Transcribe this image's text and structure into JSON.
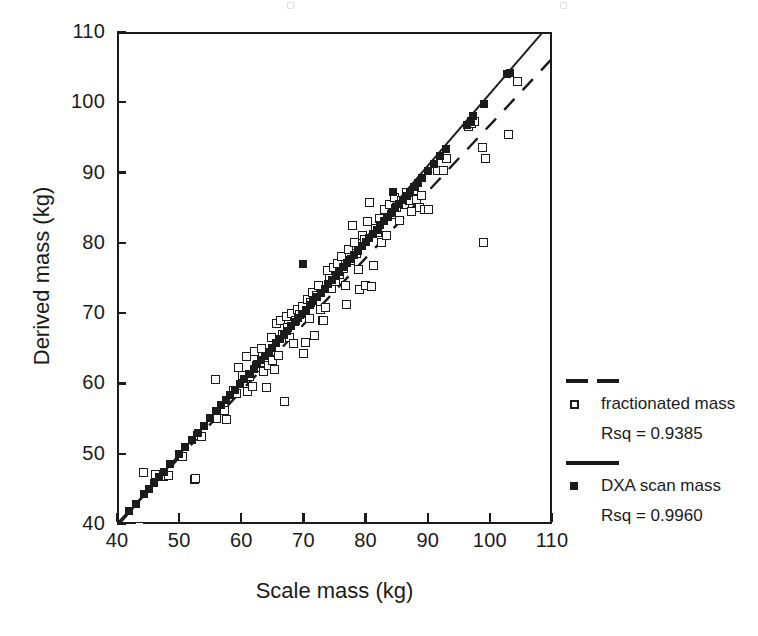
{
  "chart_data": {
    "type": "scatter",
    "title": "",
    "xlabel": "Scale mass (kg)",
    "ylabel": "Derived mass (kg)",
    "xlim": [
      40,
      110
    ],
    "ylim": [
      40,
      110
    ],
    "xticks": [
      40,
      50,
      60,
      70,
      80,
      90,
      100,
      110
    ],
    "yticks": [
      40,
      50,
      60,
      70,
      80,
      90,
      100,
      110
    ],
    "grid": false,
    "legend_position": "right",
    "marker_colors": {
      "open": "#ffffff",
      "edge": "#1b1b1b",
      "filled": "#1b1b1b"
    },
    "series": [
      {
        "name": "fractionated mass",
        "marker": "open-square",
        "rsq_label": "Rsq = 0.9385",
        "rsq": 0.9385,
        "fit_line": {
          "style": "dashed",
          "x": [
            40,
            110
          ],
          "y": [
            40,
            106.2
          ]
        },
        "points": [
          [
            43.6,
            39.6
          ],
          [
            44.3,
            47.3
          ],
          [
            46.2,
            47.0
          ],
          [
            47.5,
            46.8
          ],
          [
            48.3,
            46.9
          ],
          [
            50.6,
            49.6
          ],
          [
            52.4,
            46.4
          ],
          [
            52.6,
            46.5
          ],
          [
            53.0,
            52.6
          ],
          [
            53.6,
            52.5
          ],
          [
            55.8,
            60.5
          ],
          [
            56.0,
            55.0
          ],
          [
            56.8,
            56.2
          ],
          [
            57.3,
            56.1
          ],
          [
            57.6,
            54.9
          ],
          [
            58.8,
            59.0
          ],
          [
            59.2,
            58.6
          ],
          [
            59.6,
            62.2
          ],
          [
            60.2,
            61.1
          ],
          [
            60.8,
            63.8
          ],
          [
            61.0,
            58.9
          ],
          [
            61.4,
            61.0
          ],
          [
            61.8,
            59.6
          ],
          [
            62.1,
            64.6
          ],
          [
            62.5,
            62.5
          ],
          [
            62.9,
            62.2
          ],
          [
            63.2,
            65.0
          ],
          [
            63.5,
            61.7
          ],
          [
            63.8,
            63.0
          ],
          [
            64.0,
            59.4
          ],
          [
            64.4,
            62.5
          ],
          [
            64.8,
            66.5
          ],
          [
            65.0,
            63.3
          ],
          [
            65.4,
            62.0
          ],
          [
            65.6,
            68.5
          ],
          [
            66.0,
            64.0
          ],
          [
            66.3,
            69.0
          ],
          [
            66.6,
            67.0
          ],
          [
            66.9,
            57.5
          ],
          [
            67.2,
            69.5
          ],
          [
            67.5,
            68.0
          ],
          [
            67.8,
            66.5
          ],
          [
            68.0,
            70.0
          ],
          [
            68.4,
            65.7
          ],
          [
            68.8,
            68.9
          ],
          [
            69.0,
            70.5
          ],
          [
            69.4,
            69.8
          ],
          [
            69.8,
            71.0
          ],
          [
            70.0,
            64.2
          ],
          [
            70.3,
            65.8
          ],
          [
            70.6,
            72.0
          ],
          [
            70.9,
            69.2
          ],
          [
            71.2,
            71.5
          ],
          [
            71.5,
            73.0
          ],
          [
            71.8,
            66.8
          ],
          [
            72.1,
            72.5
          ],
          [
            72.4,
            74.0
          ],
          [
            72.7,
            70.5
          ],
          [
            73.0,
            68.9
          ],
          [
            73.3,
            69.0
          ],
          [
            73.6,
            70.8
          ],
          [
            73.9,
            76.0
          ],
          [
            74.2,
            75.0
          ],
          [
            74.5,
            73.5
          ],
          [
            74.8,
            76.5
          ],
          [
            75.1,
            74.5
          ],
          [
            75.5,
            77.0
          ],
          [
            75.8,
            75.5
          ],
          [
            76.1,
            78.0
          ],
          [
            76.4,
            76.3
          ],
          [
            76.8,
            74.0
          ],
          [
            77.0,
            71.2
          ],
          [
            77.3,
            79.0
          ],
          [
            77.6,
            77.5
          ],
          [
            77.9,
            82.5
          ],
          [
            78.2,
            80.0
          ],
          [
            78.5,
            78.5
          ],
          [
            78.8,
            76.2
          ],
          [
            79.1,
            73.3
          ],
          [
            79.5,
            81.0
          ],
          [
            79.8,
            80.5
          ],
          [
            80.0,
            74.0
          ],
          [
            80.3,
            83.0
          ],
          [
            80.6,
            85.8
          ],
          [
            81.0,
            73.8
          ],
          [
            81.3,
            76.8
          ],
          [
            81.6,
            82.0
          ],
          [
            81.9,
            81.5
          ],
          [
            82.2,
            83.5
          ],
          [
            82.6,
            80.1
          ],
          [
            83.0,
            84.8
          ],
          [
            83.4,
            81.0
          ],
          [
            83.8,
            85.5
          ],
          [
            84.2,
            84.0
          ],
          [
            84.6,
            86.5
          ],
          [
            85.0,
            85.0
          ],
          [
            85.4,
            83.2
          ],
          [
            85.8,
            86.0
          ],
          [
            86.2,
            85.4
          ],
          [
            86.6,
            87.2
          ],
          [
            87.0,
            86.0
          ],
          [
            87.4,
            84.5
          ],
          [
            87.8,
            87.5
          ],
          [
            88.2,
            86.2
          ],
          [
            88.6,
            85.0
          ],
          [
            89.0,
            86.8
          ],
          [
            89.5,
            84.8
          ],
          [
            90.2,
            84.7
          ],
          [
            91.5,
            90.3
          ],
          [
            92.5,
            90.3
          ],
          [
            93.0,
            92.0
          ],
          [
            96.5,
            96.5
          ],
          [
            97.0,
            97.0
          ],
          [
            97.6,
            97.3
          ],
          [
            98.8,
            93.5
          ],
          [
            99.0,
            80.1
          ],
          [
            99.3,
            92.0
          ],
          [
            103.0,
            95.4
          ],
          [
            104.5,
            103.0
          ]
        ]
      },
      {
        "name": "DXA scan mass",
        "marker": "filled-square",
        "rsq_label": "Rsq = 0.9960",
        "rsq": 0.996,
        "fit_line": {
          "style": "solid",
          "x": [
            40,
            110
          ],
          "y": [
            39.6,
            111.5
          ]
        },
        "points": [
          [
            40.2,
            39.8
          ],
          [
            42.0,
            41.8
          ],
          [
            43.0,
            42.8
          ],
          [
            44.4,
            44.2
          ],
          [
            45.2,
            45.0
          ],
          [
            46.0,
            45.9
          ],
          [
            46.8,
            46.7
          ],
          [
            47.5,
            47.4
          ],
          [
            48.5,
            48.5
          ],
          [
            50.0,
            50.0
          ],
          [
            51.0,
            51.0
          ],
          [
            52.0,
            52.0
          ],
          [
            53.0,
            53.0
          ],
          [
            54.0,
            54.0
          ],
          [
            55.0,
            55.1
          ],
          [
            56.0,
            56.1
          ],
          [
            56.8,
            56.9
          ],
          [
            57.5,
            57.6
          ],
          [
            58.2,
            58.3
          ],
          [
            59.0,
            59.1
          ],
          [
            59.8,
            59.9
          ],
          [
            60.5,
            60.6
          ],
          [
            61.2,
            61.3
          ],
          [
            62.0,
            62.1
          ],
          [
            62.6,
            62.7
          ],
          [
            63.2,
            63.3
          ],
          [
            63.8,
            63.9
          ],
          [
            64.4,
            64.5
          ],
          [
            65.0,
            65.1
          ],
          [
            65.6,
            65.7
          ],
          [
            66.2,
            66.3
          ],
          [
            66.8,
            66.9
          ],
          [
            67.4,
            67.5
          ],
          [
            68.0,
            68.1
          ],
          [
            68.6,
            68.7
          ],
          [
            69.2,
            69.3
          ],
          [
            69.8,
            69.9
          ],
          [
            70.0,
            77.0
          ],
          [
            70.4,
            70.5
          ],
          [
            71.0,
            71.1
          ],
          [
            71.6,
            71.7
          ],
          [
            72.2,
            72.3
          ],
          [
            72.8,
            72.9
          ],
          [
            73.4,
            73.5
          ],
          [
            74.0,
            74.1
          ],
          [
            74.6,
            74.7
          ],
          [
            75.2,
            75.3
          ],
          [
            75.8,
            75.9
          ],
          [
            76.4,
            76.5
          ],
          [
            77.0,
            77.1
          ],
          [
            77.6,
            77.7
          ],
          [
            78.2,
            78.3
          ],
          [
            78.8,
            78.9
          ],
          [
            79.4,
            79.5
          ],
          [
            80.0,
            80.1
          ],
          [
            80.6,
            80.7
          ],
          [
            81.2,
            81.3
          ],
          [
            81.8,
            81.9
          ],
          [
            82.4,
            82.5
          ],
          [
            83.0,
            83.1
          ],
          [
            83.6,
            83.7
          ],
          [
            84.2,
            84.3
          ],
          [
            84.4,
            87.2
          ],
          [
            84.8,
            84.9
          ],
          [
            85.4,
            85.5
          ],
          [
            86.0,
            86.1
          ],
          [
            86.6,
            86.7
          ],
          [
            87.2,
            87.3
          ],
          [
            87.8,
            87.9
          ],
          [
            88.4,
            88.5
          ],
          [
            89.0,
            89.2
          ],
          [
            90.0,
            90.2
          ],
          [
            91.0,
            91.2
          ],
          [
            92.0,
            92.3
          ],
          [
            93.0,
            93.3
          ],
          [
            96.4,
            96.8
          ],
          [
            97.0,
            97.4
          ],
          [
            97.3,
            98.0
          ],
          [
            99.0,
            99.8
          ],
          [
            102.8,
            104.0
          ],
          [
            103.2,
            104.2
          ]
        ]
      }
    ]
  },
  "legend": {
    "entries": [
      {
        "line_style": "dashed",
        "marker": "open-square",
        "label": "fractionated mass",
        "rsq": "Rsq = 0.9385"
      },
      {
        "line_style": "solid",
        "marker": "filled-square",
        "label": "DXA scan mass",
        "rsq": "Rsq = 0.9960"
      }
    ]
  }
}
